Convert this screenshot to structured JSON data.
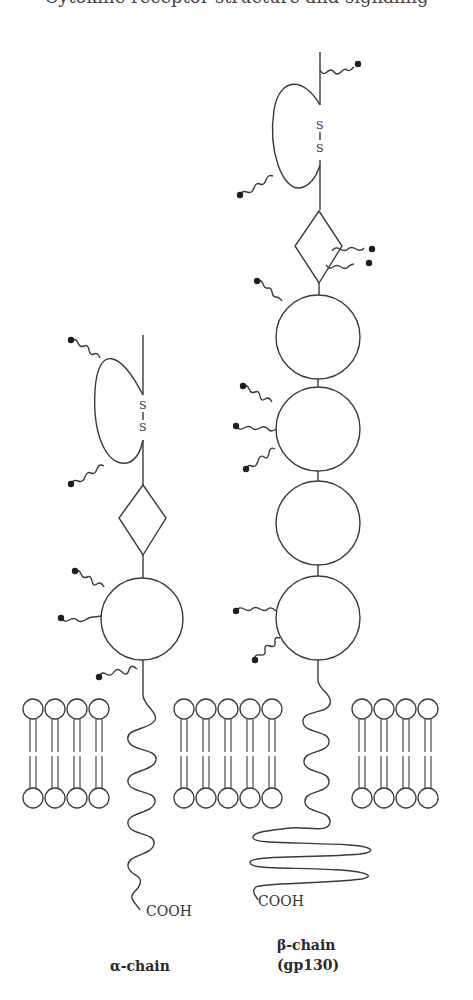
{
  "header": {
    "cut_off_text": "Cytokine receptor structure and signaling"
  },
  "diagram": {
    "type": "receptor-schematic",
    "chains": [
      {
        "id": "alpha",
        "label_line1": "α-chain",
        "label_line2": "",
        "terminus": "COOH",
        "disulfide": "S–S",
        "disulfide_top": "S",
        "disulfide_bottom": "S",
        "domains": [
          "loop (S–S)",
          "diamond",
          "circle"
        ],
        "glycosylation_sites": 6
      },
      {
        "id": "beta",
        "label_line1": "β-chain",
        "label_line2": "(gp130)",
        "terminus": "COOH",
        "disulfide": "S–S",
        "disulfide_top": "S",
        "disulfide_bottom": "S",
        "domains": [
          "loop (S–S)",
          "diamond",
          "circle",
          "circle",
          "circle",
          "circle"
        ],
        "glycosylation_sites": 11
      }
    ],
    "membrane": {
      "groups": [
        {
          "position": "left",
          "lipids": 4
        },
        {
          "position": "middle",
          "lipids": 5
        },
        {
          "position": "right",
          "lipids": 4
        }
      ]
    },
    "colors": {
      "line": "#3a3a3a",
      "dot": "#1e1e1e",
      "background": "#ffffff"
    }
  }
}
